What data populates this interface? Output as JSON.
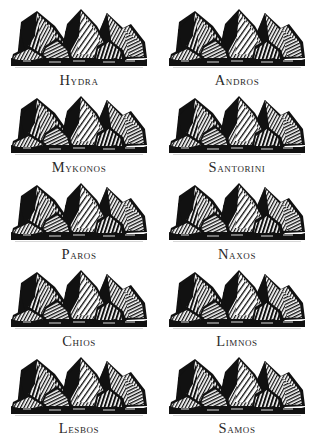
{
  "page": {
    "background_color": "#ffffff",
    "ink_color": "#111111",
    "columns": 2,
    "rows": 5
  },
  "plates": [
    {
      "caption": "Hydra",
      "illustration": "mountain-range-woodcut",
      "column": "left",
      "row": 1
    },
    {
      "caption": "Andros",
      "illustration": "mountain-range-woodcut",
      "column": "right",
      "row": 1
    },
    {
      "caption": "Mykonos",
      "illustration": "mountain-range-woodcut",
      "column": "left",
      "row": 2
    },
    {
      "caption": "Santorini",
      "illustration": "mountain-range-woodcut",
      "column": "right",
      "row": 2
    },
    {
      "caption": "Paros",
      "illustration": "mountain-range-woodcut",
      "column": "left",
      "row": 3
    },
    {
      "caption": "Naxos",
      "illustration": "mountain-range-woodcut",
      "column": "right",
      "row": 3
    },
    {
      "caption": "Chios",
      "illustration": "mountain-range-woodcut",
      "column": "left",
      "row": 4
    },
    {
      "caption": "Limnos",
      "illustration": "mountain-range-woodcut",
      "column": "right",
      "row": 4
    },
    {
      "caption": "Lesbos",
      "illustration": "mountain-range-woodcut",
      "column": "left",
      "row": 5
    },
    {
      "caption": "Samos",
      "illustration": "mountain-range-woodcut",
      "column": "right",
      "row": 5
    }
  ]
}
